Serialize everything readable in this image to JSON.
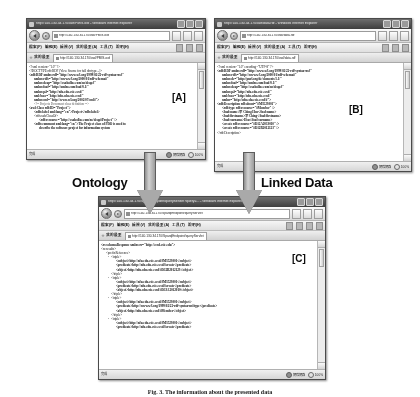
{
  "figure": {
    "caption": "Fig. 3. The information about the presented data",
    "tag_a": "[A]",
    "tag_b": "[B]",
    "tag_c": "[C]"
  },
  "arrows": {
    "left_label": "Ontology",
    "right_label": "Linked Data"
  },
  "browser_common": {
    "menu_items": [
      "檔案(F)",
      "編輯(E)",
      "檢視(V)",
      "我的最愛(A)",
      "工具(T)",
      "說明(H)"
    ],
    "favorites_label": "我的最愛",
    "status_done": "完成",
    "status_zone": "網際網路",
    "zoom_level": "100%",
    "back_icon": "back-arrow-icon",
    "forward_icon": "forward-arrow-icon",
    "refresh_icon": "refresh-icon",
    "stop_icon": "stop-icon",
    "home_icon": "home-icon",
    "search_icon": "search-icon",
    "print_icon": "print-icon",
    "page_icon": "page-icon",
    "tools_icon": "tools-icon",
    "star_icon": "star-icon",
    "globe_icon": "globe-icon",
    "zoom_icon": "zoom-icon"
  },
  "window_a": {
    "title": "http://140.130.34.170/owl/PMIS.owl - Windows Internet Explorer",
    "address": "http://140.130.34.170/owl/PMIS.owl",
    "tab_label": "http://140.130.34.170/owl/PMIS.owl",
    "code_lines": [
      {
        "text": "<?xml version=\"1.0\" ?>",
        "indent": 0,
        "bold": false,
        "dash": false
      },
      {
        "text": "<!DOCTYPE rdf:RDF (View Source for full doctype...)>",
        "indent": 0,
        "bold": false,
        "dash": false
      },
      {
        "text": "<rdf:RDF xmlns:rdf=\"http://www.w3.org/1999/02/22-rdf-syntax-ns#\"",
        "indent": 0,
        "bold": true,
        "dash": true
      },
      {
        "text": "xmlns:rdfs=\"http://www.w3.org/2000/01/rdf-schema#\"",
        "indent": 1,
        "bold": true,
        "dash": false
      },
      {
        "text": "xmlns:dcap=\"http://exoholloc.com/ns/dcap#\"",
        "indent": 1,
        "bold": true,
        "dash": false
      },
      {
        "text": "xmlns:foaf=\"http://xmlns.com/foaf/0.1/\"",
        "indent": 1,
        "bold": true,
        "dash": false
      },
      {
        "text": "xmlns:p4=\"http://nfu.edu.csie.ccsd/\"",
        "indent": 1,
        "bold": true,
        "dash": false
      },
      {
        "text": "xml:base=\"http://nfu.edu.csie.ccsd/\"",
        "indent": 1,
        "bold": true,
        "dash": false
      },
      {
        "text": "xmlns:owl=\"http://www.w3.org/2002/07/owl#\">",
        "indent": 1,
        "bold": true,
        "dash": false
      },
      {
        "text": "<!--   Projects Document class definition   -->",
        "indent": 1,
        "bold": false,
        "dash": false,
        "comment": true
      },
      {
        "text": "<owl:Class rdf:ID=\"Project\">",
        "indent": 0,
        "bold": true,
        "dash": true
      },
      {
        "text": "<rdfs:label xml:lang=\"en\">Project</rdfs:label>",
        "indent": 1,
        "bold": true,
        "dash": false
      },
      {
        "text": "<rdfs:subClassOf>",
        "indent": 1,
        "bold": false,
        "dash": false
      },
      {
        "text": "<rdf:resource=\"http://exoholloc.com/ns/dcap#Project\" />",
        "indent": 2,
        "bold": true,
        "dash": false
      },
      {
        "text": "<rdfs:comment xml:lang=\"en\">The Project class of PDO is used to",
        "indent": 1,
        "bold": true,
        "dash": false
      },
      {
        "text": "describe the software project for information system",
        "indent": 2,
        "bold": true,
        "dash": false
      }
    ]
  },
  "window_b": {
    "title": "http://140.130.34.170/owl/data.rdf - Windows Internet Explorer",
    "address": "http://140.130.34.170/owl/data.rdf",
    "tab_label": "http://140.130.34.170/owl/data.rdf",
    "code_lines": [
      {
        "text": "<?xml version=\"1.0\" encoding=\"UTF-8\" ?>",
        "indent": 0,
        "bold": false,
        "dash": false
      },
      {
        "text": "<rdf:RDF xmlns:rdf=\"http://www.w3.org/1999/02/22-rdf-syntax-ns#\"",
        "indent": 0,
        "bold": true,
        "dash": true
      },
      {
        "text": "xmlns:rdfs=\"http://www.w3.org/2000/01/rdf-schema#\"",
        "indent": 1,
        "bold": true,
        "dash": false
      },
      {
        "text": "xmlns:dc=\"http://purl.org/dc/elements/1.1/\"",
        "indent": 1,
        "bold": true,
        "dash": false
      },
      {
        "text": "xmlns:foaf=\"http://xmlns.com/foaf/0.1/\"",
        "indent": 1,
        "bold": true,
        "dash": false
      },
      {
        "text": "xmlns:dcap=\"http://exoholloc.com/ns/dcap#\"",
        "indent": 1,
        "bold": true,
        "dash": false
      },
      {
        "text": "xmlns:p4=\"http://nfu.edu.csie.ccsd/\"",
        "indent": 1,
        "bold": true,
        "dash": false
      },
      {
        "text": "xml:base=\"http://nfu.edu.csie.ccsd/\"",
        "indent": 1,
        "bold": true,
        "dash": false
      },
      {
        "text": "xmlns=\"http://nfu.edu.csie.ccsd/#\">",
        "indent": 1,
        "bold": true,
        "dash": false
      },
      {
        "text": "<rdf:Description rdf:about=\"#M3523001\">",
        "indent": 0,
        "bold": true,
        "dash": true
      },
      {
        "text": "<rdf:type rdf:resource=\"#Member\" />",
        "indent": 1,
        "bold": true,
        "dash": false
      },
      {
        "text": "<foaf:name>李 Ching Hsu</foaf:name>",
        "indent": 1,
        "bold": true,
        "dash": false
      },
      {
        "text": "<foaf:firstname>李 Ching</foaf:firstname>",
        "indent": 1,
        "bold": true,
        "dash": false
      },
      {
        "text": "<foaf:surname>Hsu</foaf:surname>",
        "indent": 1,
        "bold": true,
        "dash": false
      },
      {
        "text": "<create rdf:resource=\"#D12A2013010\" />",
        "indent": 1,
        "bold": true,
        "dash": false
      },
      {
        "text": "<create rdf:resource=\"#D12B2012123\" />",
        "indent": 1,
        "bold": true,
        "dash": false
      },
      {
        "text": "</rdf:Description>",
        "indent": 0,
        "bold": false,
        "dash": false
      }
    ]
  },
  "window_c": {
    "title": "http://140.130.34.170/SparqlEndpoint/queryServlet?query=... - Windows Internet Explorer",
    "address": "http://140.130.34.170/SparqlEndpoint/queryServlet",
    "tab_label": "http://140.130.34.170/SparqlEndpoint/queryServlet",
    "code_lines": [
      {
        "text": "<rs:schemaResponse xmlns:rs=\"http://ccsd.csie.edu\">",
        "indent": 0,
        "bold": true,
        "dash": false
      },
      {
        "text": "<rs:results>",
        "indent": 0,
        "bold": false,
        "dash": false
      },
      {
        "text": "<prefixReference>",
        "indent": 1,
        "bold": false,
        "dash": false
      },
      {
        "text": "<triple>",
        "indent": 2,
        "bold": false,
        "dash": true
      },
      {
        "text": "<subject>http://nfu.edu.csie.ccsd/#M3523001</subject>",
        "indent": 3,
        "bold": true,
        "dash": false
      },
      {
        "text": "<predicate>http://nfu.edu.csie.ccsd/#create</predicate>",
        "indent": 3,
        "bold": true,
        "dash": false
      },
      {
        "text": "<object>http://nfu.edu.csie.ccsd/#D12B2012123</object>",
        "indent": 3,
        "bold": true,
        "dash": false
      },
      {
        "text": "</triple>",
        "indent": 2,
        "bold": false,
        "dash": false
      },
      {
        "text": "<triple>",
        "indent": 2,
        "bold": false,
        "dash": true
      },
      {
        "text": "<subject>http://nfu.edu.csie.ccsd/#M3523001</subject>",
        "indent": 3,
        "bold": true,
        "dash": false
      },
      {
        "text": "<predicate>http://nfu.edu.csie.ccsd/#create</predicate>",
        "indent": 3,
        "bold": true,
        "dash": false
      },
      {
        "text": "<object>http://nfu.edu.csie.ccsd/#D13A2012010</object>",
        "indent": 3,
        "bold": true,
        "dash": false
      },
      {
        "text": "</triple>",
        "indent": 2,
        "bold": false,
        "dash": false
      },
      {
        "text": "<triple>",
        "indent": 2,
        "bold": false,
        "dash": true
      },
      {
        "text": "<subject>http://nfu.edu.csie.ccsd/#M3523001</subject>",
        "indent": 3,
        "bold": true,
        "dash": false
      },
      {
        "text": "<predicate>http://www.w3.org/1999/02/22-rdf-syntax-ns#type</predicate>",
        "indent": 3,
        "bold": true,
        "dash": false
      },
      {
        "text": "<object>http://nfu.edu.csie.ccsd/#Member</object>",
        "indent": 3,
        "bold": true,
        "dash": false
      },
      {
        "text": "</triple>",
        "indent": 2,
        "bold": false,
        "dash": false
      },
      {
        "text": "<triple>",
        "indent": 2,
        "bold": false,
        "dash": true
      },
      {
        "text": "<subject>http://nfu.edu.csie.ccsd/#M3523001</subject>",
        "indent": 3,
        "bold": true,
        "dash": false
      },
      {
        "text": "<predicate>http://nfu.edu.csie.ccsd/#create</predicate>",
        "indent": 3,
        "bold": true,
        "dash": false
      }
    ]
  }
}
